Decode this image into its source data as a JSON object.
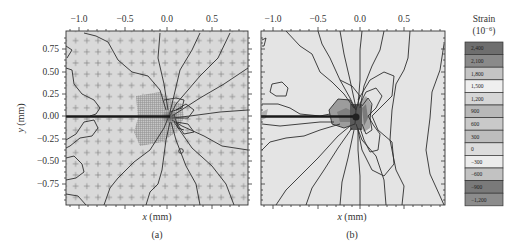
{
  "figure": {
    "panels": [
      {
        "id": "a",
        "label": "(a)",
        "xlabel_var": "x",
        "xlabel_unit": " (mm)",
        "ylabel_var": "y",
        "ylabel_unit": " (mm)",
        "x_ticks": [
          "−1.0",
          "−0.5",
          "0.0",
          "0.5"
        ],
        "y_ticks": [
          "0.75",
          "0.50",
          "0.25",
          "0.00",
          "−0.25",
          "−0.50",
          "−0.75"
        ],
        "note": "Measured strain field with data-point grid markers (+) and refined mesh near crack tip"
      },
      {
        "id": "b",
        "label": "(b)",
        "xlabel_var": "x",
        "xlabel_unit": " (mm)",
        "x_ticks": [
          "−1.0",
          "−0.5",
          "0.0",
          "0.5"
        ],
        "note": "Computed strain field contours around crack tip"
      }
    ],
    "colorbar": {
      "title": "Strain",
      "unit_base": "(10",
      "unit_exp": "−6",
      "unit_close": ")",
      "levels": [
        "2,400",
        "2,100",
        "1,800",
        "1,500",
        "1,200",
        "900",
        "600",
        "300",
        "0",
        "−300",
        "−600",
        "−900",
        "−1,200"
      ],
      "colors": [
        "#6e6e6e",
        "#8a8a8a",
        "#c4c4c4",
        "#efefef",
        "#d6d6d6",
        "#b8b8b8",
        "#c9c9c9",
        "#bdbdbd",
        "#dcdcdc",
        "#ececec",
        "#c2c2c2",
        "#7a7a7a",
        "#8c8c8c"
      ]
    }
  },
  "chart_data": {
    "type": "heatmap",
    "title": "",
    "subtype": "contour",
    "panels": [
      {
        "label": "(a)",
        "xlabel": "x (mm)",
        "ylabel": "y (mm)",
        "xlim": [
          -1.15,
          0.85
        ],
        "ylim": [
          -0.95,
          0.95
        ],
        "x_ticks": [
          -1.0,
          -0.5,
          0.0,
          0.5
        ],
        "y_ticks": [
          0.75,
          0.5,
          0.25,
          0.0,
          -0.25,
          -0.5,
          -0.75
        ],
        "features": [
          "crack along y=0 from x=-1.15 to x≈0.0",
          "crack tip at (0.05, 0.0)",
          "radial contour lines concentrated at crack tip",
          "grid of + measurement points",
          "refined hatched mesh region x∈[-0.3,0.2], y∈[-0.35,0.2]"
        ]
      },
      {
        "label": "(b)",
        "xlabel": "x (mm)",
        "ylabel": "",
        "xlim": [
          -1.15,
          0.85
        ],
        "ylim": [
          -0.95,
          0.95
        ],
        "x_ticks": [
          -1.0,
          -0.5,
          0.0,
          0.5
        ],
        "features": [
          "crack along y=0 from x=-1.15 to x≈0.0",
          "butterfly-shaped contour lobes ahead of crack tip",
          "dark high-strain regions near tip"
        ]
      }
    ],
    "colorbar": {
      "label": "Strain (10^-6)",
      "levels": [
        2400,
        2100,
        1800,
        1500,
        1200,
        900,
        600,
        300,
        0,
        -300,
        -600,
        -900,
        -1200
      ]
    }
  }
}
